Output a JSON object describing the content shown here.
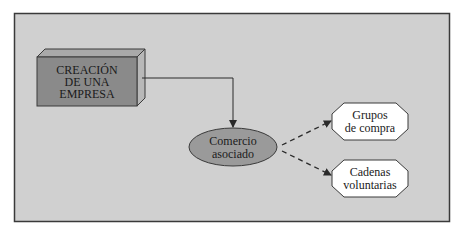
{
  "diagram": {
    "colors": {
      "page_background": "#ffffff",
      "panel_background": "#d0d0d0",
      "panel_border": "#3a3a3a",
      "box_front": "#8a8a8a",
      "box_top": "#a9a9a9",
      "box_side": "#b8b8b8",
      "ellipse_fill": "#9a9a9a",
      "octagon_fill": "#ffffff",
      "line": "#2a2a2a"
    },
    "nodes": {
      "company_creation": {
        "shape": "3d-box",
        "lines": [
          "CREACIÓN",
          "DE UNA",
          "EMPRESA"
        ]
      },
      "associated_commerce": {
        "shape": "ellipse",
        "lines": [
          "Comercio",
          "asociado"
        ]
      },
      "purchasing_groups": {
        "shape": "octagon",
        "lines": [
          "Grupos",
          "de compra"
        ]
      },
      "voluntary_chains": {
        "shape": "octagon",
        "lines": [
          "Cadenas",
          "voluntarias"
        ]
      }
    },
    "edges": [
      {
        "from": "company_creation",
        "to": "associated_commerce",
        "style": "solid",
        "arrow": "end"
      },
      {
        "from": "associated_commerce",
        "to": "purchasing_groups",
        "style": "dashed",
        "arrow": "end"
      },
      {
        "from": "associated_commerce",
        "to": "voluntary_chains",
        "style": "dashed",
        "arrow": "end"
      }
    ]
  }
}
